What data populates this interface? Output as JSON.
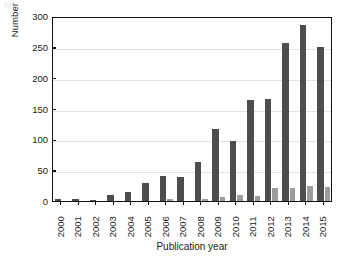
{
  "chart_data": {
    "type": "bar",
    "title": "",
    "xlabel": "Publication year",
    "ylabel": "Number of publication",
    "categories": [
      "2000",
      "2001",
      "2002",
      "2003",
      "2004",
      "2005",
      "2006",
      "2007",
      "2008",
      "2009",
      "2010",
      "2011",
      "2012",
      "2013",
      "2014",
      "2015"
    ],
    "series": [
      {
        "name": "primary",
        "color": "#4d4d4d",
        "values": [
          3,
          3,
          1,
          10,
          14,
          30,
          41,
          39,
          63,
          117,
          97,
          164,
          166,
          257,
          285,
          249
        ]
      },
      {
        "name": "secondary",
        "color": "#9c9c9c",
        "values": [
          0,
          0,
          0,
          0,
          0,
          0,
          3,
          0,
          3,
          6,
          10,
          8,
          21,
          21,
          25,
          23
        ]
      }
    ],
    "ylim": [
      0,
      300
    ],
    "yticks": [
      0,
      50,
      100,
      150,
      200,
      250,
      300
    ],
    "ytick_labels": [
      "0",
      "50",
      "100",
      "150",
      "200",
      "250",
      "300"
    ],
    "grid": true,
    "grid_axis": "y",
    "legend": "none",
    "frame": true
  },
  "axes": {
    "y_title": "Number of publication",
    "x_title": "Publication year"
  }
}
